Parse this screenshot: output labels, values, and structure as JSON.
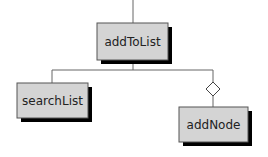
{
  "diagram": {
    "type": "structure-chart",
    "colors": {
      "box_fill": "#d4d4d4",
      "box_border": "#555555",
      "shadow": "#000000",
      "line": "#666666"
    },
    "nodes": [
      {
        "id": "addToList",
        "label": "addToList",
        "level": 0
      },
      {
        "id": "searchList",
        "label": "searchList",
        "level": 1
      },
      {
        "id": "addNode",
        "label": "addNode",
        "level": 1,
        "connector": "conditional-diamond"
      }
    ],
    "edges": [
      {
        "from": "addToList",
        "to": "searchList"
      },
      {
        "from": "addToList",
        "to": "addNode",
        "conditional": true
      }
    ]
  }
}
